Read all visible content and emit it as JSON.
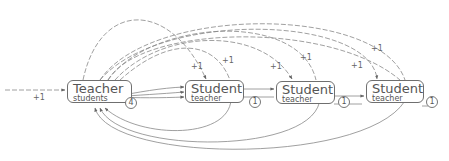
{
  "diagram": {
    "nodes": [
      {
        "id": "teacher",
        "title": "Teacher",
        "field": "students",
        "count": "4"
      },
      {
        "id": "student1",
        "title": "Student",
        "field": "teacher",
        "count": "1"
      },
      {
        "id": "student2",
        "title": "Student",
        "field": "teacher",
        "count": "1"
      },
      {
        "id": "student3",
        "title": "Student",
        "field": "teacher",
        "count": "1"
      }
    ],
    "edge_labels": {
      "incoming": "+1",
      "to_student1_a": "+1",
      "to_student1_b": "+1",
      "to_student2_a": "+1",
      "to_student2_b": "+1",
      "to_student3_a": "+1",
      "to_student3_b": "+1"
    },
    "colors": {
      "edge": "#777777",
      "node_border": "#6f6f6f",
      "text": "#555555"
    }
  }
}
